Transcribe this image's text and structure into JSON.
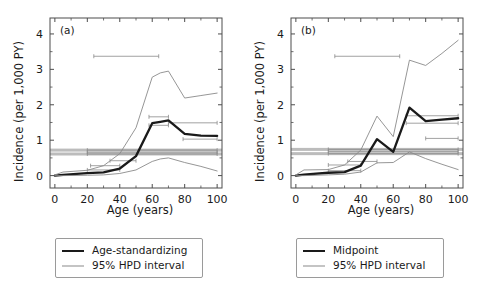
{
  "figure": {
    "background": "#ffffff",
    "panels": [
      "a",
      "b"
    ]
  },
  "colors": {
    "main_line": "#1a1a1a",
    "hpd_line": "#8a8a8a",
    "overall_band": "#b0b0b0",
    "axis": "#4d4d4d",
    "text": "#1a1a1a"
  },
  "panel_a": {
    "tag": "(a)",
    "xlabel": "Age (years)",
    "ylabel": "Incidence (per 1,000 PY)",
    "legend": {
      "main_label": "Age-standardizing",
      "hpd_label": "95% HPD interval"
    }
  },
  "panel_b": {
    "tag": "(b)",
    "xlabel": "Age (years)",
    "ylabel": "Incidence (per 1,000 PY)",
    "legend": {
      "main_label": "Midpoint",
      "hpd_label": "95% HPD interval"
    }
  },
  "chart_data": [
    {
      "type": "line",
      "panel": "(a)",
      "title": "",
      "xlabel": "Age (years)",
      "ylabel": "Incidence (per 1,000 PY)",
      "xlim": [
        -3,
        103
      ],
      "ylim": [
        -0.35,
        4.45
      ],
      "xticks": [
        0,
        20,
        40,
        60,
        80,
        100
      ],
      "yticks": [
        0,
        1,
        2,
        3,
        4
      ],
      "grid": false,
      "legend_position": "below-axes",
      "series": [
        {
          "name": "Age-standardizing",
          "style": "thick-dark",
          "x": [
            0,
            5,
            20,
            30,
            40,
            50,
            60,
            65,
            70,
            80,
            90,
            100
          ],
          "values": [
            0.0,
            0.02,
            0.07,
            0.09,
            0.2,
            0.55,
            1.48,
            1.52,
            1.56,
            1.18,
            1.13,
            1.12
          ]
        },
        {
          "name": "95% HPD upper",
          "style": "thin-gray",
          "x": [
            0,
            5,
            20,
            30,
            40,
            50,
            60,
            65,
            70,
            80,
            90,
            100
          ],
          "values": [
            0.02,
            0.1,
            0.15,
            0.28,
            0.62,
            1.35,
            2.78,
            2.9,
            2.95,
            2.19,
            2.26,
            2.33
          ]
        },
        {
          "name": "95% HPD lower",
          "style": "thin-gray",
          "x": [
            0,
            5,
            20,
            30,
            40,
            50,
            60,
            65,
            70,
            80,
            90,
            100
          ],
          "values": [
            0.0,
            0.0,
            0.01,
            0.02,
            0.06,
            0.16,
            0.4,
            0.47,
            0.5,
            0.37,
            0.26,
            0.13
          ]
        }
      ],
      "overall_band": {
        "label": "overall incidence 95% HPD band",
        "bands": [
          {
            "y_center": 0.72,
            "half_height": 0.035,
            "x_from": -3,
            "x_to": 103
          },
          {
            "y_center": 0.61,
            "half_height": 0.035,
            "x_from": -3,
            "x_to": 103
          }
        ]
      },
      "horizontal_interval_markers": [
        {
          "y": 3.37,
          "x_from": 24,
          "x_to": 64
        },
        {
          "y": 1.66,
          "x_from": 58,
          "x_to": 70
        },
        {
          "y": 1.49,
          "x_from": 70,
          "x_to": 100
        },
        {
          "y": 1.42,
          "x_from": 58,
          "x_to": 70
        },
        {
          "y": 1.03,
          "x_from": 79,
          "x_to": 100
        },
        {
          "y": 0.72,
          "x_from": 20,
          "x_to": 100
        },
        {
          "y": 0.66,
          "x_from": 20,
          "x_to": 100
        },
        {
          "y": 0.61,
          "x_from": 20,
          "x_to": 100
        },
        {
          "y": 0.42,
          "x_from": 34,
          "x_to": 50
        },
        {
          "y": 0.28,
          "x_from": 22,
          "x_to": 40
        },
        {
          "y": 0.16,
          "x_from": 20,
          "x_to": 40
        }
      ]
    },
    {
      "type": "line",
      "panel": "(b)",
      "title": "",
      "xlabel": "Age (years)",
      "ylabel": "Incidence (per 1,000 PY)",
      "xlim": [
        -3,
        103
      ],
      "ylim": [
        -0.35,
        4.45
      ],
      "xticks": [
        0,
        20,
        40,
        60,
        80,
        100
      ],
      "yticks": [
        0,
        1,
        2,
        3,
        4
      ],
      "grid": false,
      "legend_position": "below-axes",
      "series": [
        {
          "name": "Midpoint",
          "style": "thick-dark",
          "x": [
            0,
            5,
            20,
            30,
            40,
            50,
            60,
            70,
            80,
            90,
            100
          ],
          "values": [
            0.0,
            0.03,
            0.08,
            0.1,
            0.28,
            1.03,
            0.67,
            1.92,
            1.54,
            1.58,
            1.62
          ]
        },
        {
          "name": "95% HPD upper",
          "style": "thin-gray",
          "x": [
            0,
            5,
            20,
            30,
            40,
            50,
            60,
            70,
            80,
            90,
            100
          ],
          "values": [
            0.02,
            0.16,
            0.17,
            0.3,
            0.72,
            1.68,
            1.1,
            3.26,
            3.11,
            3.45,
            3.82
          ]
        },
        {
          "name": "95% HPD lower",
          "style": "thin-gray",
          "x": [
            0,
            5,
            20,
            30,
            40,
            50,
            60,
            70,
            80,
            90,
            100
          ],
          "values": [
            0.0,
            0.0,
            0.02,
            0.04,
            0.1,
            0.36,
            0.37,
            0.67,
            0.48,
            0.32,
            0.17
          ]
        }
      ],
      "overall_band": {
        "label": "overall incidence 95% HPD band",
        "bands": [
          {
            "y_center": 0.74,
            "half_height": 0.04,
            "x_from": -3,
            "x_to": 103
          },
          {
            "y_center": 0.62,
            "half_height": 0.04,
            "x_from": -3,
            "x_to": 103
          }
        ]
      },
      "horizontal_interval_markers": [
        {
          "y": 3.37,
          "x_from": 24,
          "x_to": 64
        },
        {
          "y": 1.69,
          "x_from": 68,
          "x_to": 100
        },
        {
          "y": 1.48,
          "x_from": 68,
          "x_to": 100
        },
        {
          "y": 1.05,
          "x_from": 80,
          "x_to": 100
        },
        {
          "y": 0.74,
          "x_from": 20,
          "x_to": 100
        },
        {
          "y": 0.68,
          "x_from": 20,
          "x_to": 100
        },
        {
          "y": 0.62,
          "x_from": 20,
          "x_to": 100
        },
        {
          "y": 0.4,
          "x_from": 32,
          "x_to": 50
        },
        {
          "y": 0.3,
          "x_from": 20,
          "x_to": 40
        },
        {
          "y": 0.14,
          "x_from": 20,
          "x_to": 40
        }
      ]
    }
  ]
}
